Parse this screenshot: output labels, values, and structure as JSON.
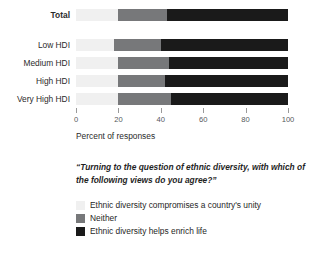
{
  "chart_data": {
    "type": "bar",
    "orientation": "horizontal",
    "stacked": true,
    "normalized": true,
    "title": "",
    "subtitle": "",
    "xlabel": "Percent of responses",
    "ylabel": "",
    "xlim": [
      0,
      100
    ],
    "xticks": [
      0,
      20,
      40,
      60,
      80,
      100
    ],
    "xtick_labels": [
      "0",
      "20",
      "40",
      "60",
      "80",
      "100"
    ],
    "grid": false,
    "legend_position": "bottom-left",
    "categories": [
      "Total",
      "Low HDI",
      "Medium HDI",
      "High HDI",
      "Very High HDI"
    ],
    "series": [
      {
        "name": "Ethnic diversity compromises a country's unity",
        "color": "#f0f0f0",
        "values": [
          20,
          18,
          20,
          20,
          20
        ]
      },
      {
        "name": "Neither",
        "color": "#77787a",
        "values": [
          23,
          22,
          24,
          22,
          25
        ]
      },
      {
        "name": "Ethnic diversity helps enrich life",
        "color": "#1a1a1a",
        "values": [
          57,
          60,
          56,
          58,
          55
        ]
      }
    ],
    "annotation": "“Turning to the question of ethnic diversity, with which of the following views do you agree?”"
  },
  "axis": {
    "xlabel": "Percent of responses",
    "ticks": [
      {
        "value": 0,
        "label": "0"
      },
      {
        "value": 20,
        "label": "20"
      },
      {
        "value": 40,
        "label": "40"
      },
      {
        "value": 60,
        "label": "60"
      },
      {
        "value": 80,
        "label": "80"
      },
      {
        "value": 100,
        "label": "100"
      }
    ]
  },
  "rows": [
    {
      "label": "Total",
      "bold": true,
      "a": 20,
      "b": 23,
      "c": 57
    },
    {
      "label": "Low HDI",
      "bold": false,
      "a": 18,
      "b": 22,
      "c": 60
    },
    {
      "label": "Medium HDI",
      "bold": false,
      "a": 20,
      "b": 24,
      "c": 56
    },
    {
      "label": "High HDI",
      "bold": false,
      "a": 20,
      "b": 22,
      "c": 58
    },
    {
      "label": "Very High HDI",
      "bold": false,
      "a": 20,
      "b": 25,
      "c": 55
    }
  ],
  "caption": "“Turning to the question of ethnic diversity, with which of the following views do you agree?”",
  "legend": {
    "items": [
      {
        "label": "Ethnic diversity compromises a country's unity",
        "color": "#f0f0f0"
      },
      {
        "label": "Neither",
        "color": "#77787a"
      },
      {
        "label": "Ethnic diversity helps enrich life",
        "color": "#1a1a1a"
      }
    ]
  },
  "colors": {
    "compromises": "#f0f0f0",
    "neither": "#77787a",
    "enrich": "#1a1a1a",
    "text": "#2b2b2b",
    "tick": "#9a9a9a"
  }
}
